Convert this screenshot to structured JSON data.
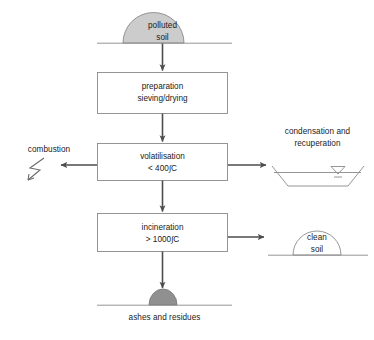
{
  "diagram": {
    "colors": {
      "line": "#8a8a8a",
      "arrow": "#4d4d4d",
      "text": "#1a1a1a",
      "polluted_soil_fill": "#cccccc",
      "ashes_fill": "#909090",
      "clean_soil_fill": "#ffffff",
      "box_stroke": "#8a8a8a",
      "box_fill": "#ffffff"
    },
    "nodes": {
      "polluted_soil": {
        "name": "polluted-soil",
        "label_line1": "polluted",
        "label_line2": "soil",
        "shape": "filled-mound-on-ground-line"
      },
      "preparation": {
        "name": "preparation",
        "label_line1": "preparation",
        "label_line2": "sieving/drying",
        "shape": "process-box"
      },
      "volatilisation": {
        "name": "volatilisation",
        "label_line1": "volatilisation",
        "label_line2": "< 400∫C",
        "shape": "process-box"
      },
      "incineration": {
        "name": "incineration",
        "label_line1": "incineration",
        "label_line2": "> 1000∫C",
        "shape": "process-box"
      },
      "combustion": {
        "name": "combustion",
        "label": "combustion",
        "shape": "lightning-bolt-symbol"
      },
      "condensation": {
        "name": "condensation-recuperation",
        "label_line1": "condensation and",
        "label_line2": "recuperation",
        "shape": "trapezoid-basin-with-water-level-marker"
      },
      "clean_soil": {
        "name": "clean-soil",
        "label_line1": "clean",
        "label_line2": "soil",
        "shape": "outline-mound-on-ground-line"
      },
      "ashes": {
        "name": "ashes-and-residues",
        "label": "ashes and residues",
        "shape": "filled-mound-on-ground-line"
      }
    },
    "flows": [
      {
        "from": "polluted_soil",
        "to": "preparation",
        "direction": "down"
      },
      {
        "from": "preparation",
        "to": "volatilisation",
        "direction": "down"
      },
      {
        "from": "volatilisation",
        "to": "combustion",
        "direction": "left"
      },
      {
        "from": "volatilisation",
        "to": "condensation",
        "direction": "right"
      },
      {
        "from": "volatilisation",
        "to": "incineration",
        "direction": "down"
      },
      {
        "from": "incineration",
        "to": "clean_soil",
        "direction": "right"
      },
      {
        "from": "incineration",
        "to": "ashes",
        "direction": "down"
      }
    ]
  }
}
